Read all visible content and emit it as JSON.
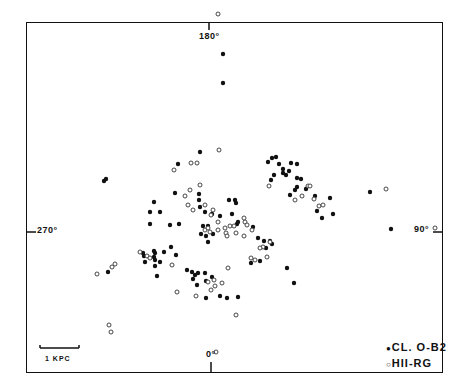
{
  "chart_data": {
    "type": "scatter",
    "title": "",
    "xlabel": "",
    "ylabel": "",
    "axis_labels": {
      "top": "180°",
      "bottom": "0°",
      "left": "270°",
      "right": "90°"
    },
    "scale_bar": "1 KPC",
    "grid": false,
    "legend": [
      {
        "marker": "filled-circle",
        "label": "CL. O-B2"
      },
      {
        "marker": "open-circle",
        "label": "HII-RG"
      }
    ],
    "legend_position": "bottom-right",
    "series": [
      {
        "name": "CL. O-B2",
        "marker": "filled",
        "points": [
          [
            223,
            54
          ],
          [
            223,
            83
          ],
          [
            104,
            181
          ],
          [
            106,
            179
          ],
          [
            200,
            152
          ],
          [
            178,
            164
          ],
          [
            175,
            193
          ],
          [
            154,
            202
          ],
          [
            150,
            212
          ],
          [
            160,
            212
          ],
          [
            150,
            224
          ],
          [
            170,
            225
          ],
          [
            179,
            224
          ],
          [
            199,
            194
          ],
          [
            199,
            200
          ],
          [
            200,
            207
          ],
          [
            205,
            212
          ],
          [
            212,
            214
          ],
          [
            203,
            226
          ],
          [
            208,
            226
          ],
          [
            201,
            234
          ],
          [
            206,
            236
          ],
          [
            213,
            234
          ],
          [
            208,
            242
          ],
          [
            220,
            216
          ],
          [
            232,
            214
          ],
          [
            229,
            200
          ],
          [
            235,
            200
          ],
          [
            236,
            203
          ],
          [
            237,
            224
          ],
          [
            238,
            222
          ],
          [
            268,
            162
          ],
          [
            272,
            158
          ],
          [
            276,
            157
          ],
          [
            279,
            164
          ],
          [
            283,
            169
          ],
          [
            286,
            175
          ],
          [
            289,
            171
          ],
          [
            274,
            175
          ],
          [
            271,
            180
          ],
          [
            283,
            173
          ],
          [
            291,
            163
          ],
          [
            297,
            164
          ],
          [
            297,
            178
          ],
          [
            301,
            179
          ],
          [
            297,
            187
          ],
          [
            290,
            195
          ],
          [
            295,
            190
          ],
          [
            306,
            189
          ],
          [
            330,
            198
          ],
          [
            315,
            196
          ],
          [
            317,
            211
          ],
          [
            322,
            218
          ],
          [
            333,
            214
          ],
          [
            370,
            192
          ],
          [
            391,
            229
          ],
          [
            253,
            227
          ],
          [
            258,
            238
          ],
          [
            264,
            241
          ],
          [
            270,
            241
          ],
          [
            272,
            244
          ],
          [
            266,
            248
          ],
          [
            251,
            263
          ],
          [
            260,
            261
          ],
          [
            287,
            268
          ],
          [
            294,
            283
          ],
          [
            108,
            272
          ],
          [
            143,
            253
          ],
          [
            144,
            256
          ],
          [
            145,
            262
          ],
          [
            154,
            251
          ],
          [
            155,
            253
          ],
          [
            154,
            257
          ],
          [
            155,
            260
          ],
          [
            155,
            266
          ],
          [
            160,
            262
          ],
          [
            164,
            252
          ],
          [
            171,
            247
          ],
          [
            176,
            255
          ],
          [
            157,
            276
          ],
          [
            187,
            270
          ],
          [
            192,
            272
          ],
          [
            193,
            279
          ],
          [
            195,
            275
          ],
          [
            198,
            273
          ],
          [
            205,
            273
          ],
          [
            197,
            285
          ],
          [
            206,
            281
          ],
          [
            212,
            277
          ],
          [
            206,
            298
          ],
          [
            220,
            296
          ],
          [
            227,
            298
          ],
          [
            238,
            297
          ]
        ]
      },
      {
        "name": "HII-RG",
        "marker": "open",
        "points": [
          [
            219,
            150
          ],
          [
            191,
            163
          ],
          [
            197,
            163
          ],
          [
            174,
            170
          ],
          [
            200,
            185
          ],
          [
            190,
            190
          ],
          [
            185,
            196
          ],
          [
            188,
            205
          ],
          [
            205,
            205
          ],
          [
            193,
            210
          ],
          [
            213,
            210
          ],
          [
            211,
            215
          ],
          [
            218,
            222
          ],
          [
            205,
            230
          ],
          [
            208,
            228
          ],
          [
            210,
            232
          ],
          [
            218,
            230
          ],
          [
            225,
            228
          ],
          [
            230,
            226
          ],
          [
            234,
            226
          ],
          [
            245,
            222
          ],
          [
            247,
            225
          ],
          [
            244,
            218
          ],
          [
            252,
            230
          ],
          [
            244,
            236
          ],
          [
            236,
            233
          ],
          [
            226,
            233
          ],
          [
            227,
            236
          ],
          [
            269,
            186
          ],
          [
            295,
            200
          ],
          [
            308,
            186
          ],
          [
            310,
            186
          ],
          [
            302,
            196
          ],
          [
            314,
            199
          ],
          [
            319,
            206
          ],
          [
            323,
            205
          ],
          [
            386,
            189
          ],
          [
            251,
            258
          ],
          [
            255,
            260
          ],
          [
            267,
            257
          ],
          [
            263,
            247
          ],
          [
            260,
            248
          ],
          [
            140,
            252
          ],
          [
            147,
            256
          ],
          [
            150,
            258
          ],
          [
            112,
            267
          ],
          [
            115,
            264
          ],
          [
            97,
            274
          ],
          [
            172,
            265
          ],
          [
            177,
            292
          ],
          [
            196,
            296
          ],
          [
            208,
            282
          ],
          [
            214,
            280
          ],
          [
            211,
            290
          ],
          [
            215,
            286
          ],
          [
            228,
            268
          ],
          [
            222,
            283
          ],
          [
            236,
            315
          ],
          [
            109,
            325
          ],
          [
            111,
            332
          ],
          [
            435,
            228
          ],
          [
            218,
            14
          ],
          [
            216,
            352
          ],
          [
            270,
            242
          ]
        ]
      }
    ]
  }
}
